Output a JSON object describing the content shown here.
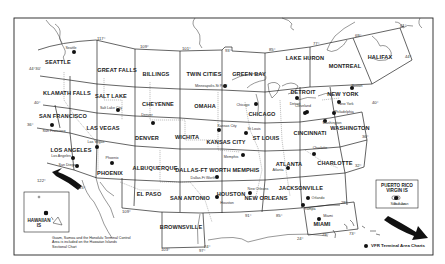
{
  "map": {
    "title": "Sectional Aeronautical Charts coverage of the United States",
    "sectionals": [
      {
        "name": "SEATTLE",
        "x": 58,
        "y": 62
      },
      {
        "name": "GREAT FALLS",
        "x": 117,
        "y": 70
      },
      {
        "name": "BILLINGS",
        "x": 156,
        "y": 74
      },
      {
        "name": "TWIN CITIES",
        "x": 204,
        "y": 74
      },
      {
        "name": "GREEN BAY",
        "x": 249,
        "y": 74
      },
      {
        "name": "LAKE HURON",
        "x": 305,
        "y": 58
      },
      {
        "name": "MONTREAL",
        "x": 345,
        "y": 66
      },
      {
        "name": "HALIFAX",
        "x": 380,
        "y": 57
      },
      {
        "name": "KLAMATH FALLS",
        "x": 67,
        "y": 93
      },
      {
        "name": "SALT LAKE",
        "x": 111,
        "y": 96
      },
      {
        "name": "CHEYENNE",
        "x": 158,
        "y": 104
      },
      {
        "name": "OMAHA",
        "x": 205,
        "y": 106
      },
      {
        "name": "CHICAGO",
        "x": 262,
        "y": 114
      },
      {
        "name": "DETROIT",
        "x": 303,
        "y": 92
      },
      {
        "name": "NEW YORK",
        "x": 343,
        "y": 94
      },
      {
        "name": "SAN FRANCISCO",
        "x": 63,
        "y": 116
      },
      {
        "name": "LAS VEGAS",
        "x": 103,
        "y": 128
      },
      {
        "name": "DENVER",
        "x": 147,
        "y": 138
      },
      {
        "name": "WICHITA",
        "x": 187,
        "y": 137
      },
      {
        "name": "KANSAS CITY",
        "x": 226,
        "y": 142
      },
      {
        "name": "ST LOUIS",
        "x": 266,
        "y": 138
      },
      {
        "name": "CINCINNATI",
        "x": 310,
        "y": 133
      },
      {
        "name": "WASHINGTON",
        "x": 350,
        "y": 128
      },
      {
        "name": "LOS ANGELES",
        "x": 71,
        "y": 150
      },
      {
        "name": "PHOENIX",
        "x": 110,
        "y": 173
      },
      {
        "name": "ALBUQUERQUE",
        "x": 155,
        "y": 168
      },
      {
        "name": "DALLAS-FT WORTH",
        "x": 203,
        "y": 170
      },
      {
        "name": "MEMPHIS",
        "x": 246,
        "y": 170
      },
      {
        "name": "ATLANTA",
        "x": 289,
        "y": 164
      },
      {
        "name": "CHARLOTTE",
        "x": 335,
        "y": 163
      },
      {
        "name": "EL PASO",
        "x": 149,
        "y": 194
      },
      {
        "name": "SAN ANTONIO",
        "x": 190,
        "y": 198
      },
      {
        "name": "HOUSTON",
        "x": 231,
        "y": 194
      },
      {
        "name": "NEW ORLEANS",
        "x": 266,
        "y": 198
      },
      {
        "name": "JACKSONVILLE",
        "x": 301,
        "y": 188
      },
      {
        "name": "BROWNSVILLE",
        "x": 181,
        "y": 227
      },
      {
        "name": "MIAMI",
        "x": 322,
        "y": 224
      }
    ],
    "terminal_areas": [
      {
        "name": "Seattle",
        "x": 74,
        "y": 52,
        "dx": 71,
        "dy": 48
      },
      {
        "name": "Minneapolis-St Paul",
        "x": 225,
        "y": 86,
        "dx": 211,
        "dy": 86
      },
      {
        "name": "Salt Lake City",
        "x": 118,
        "y": 110,
        "dx": 111,
        "dy": 108
      },
      {
        "name": "San Francisco",
        "x": 52,
        "y": 125,
        "dx": 54,
        "dy": 131
      },
      {
        "name": "Las Vegas",
        "x": 97,
        "y": 147,
        "dx": 96,
        "dy": 142
      },
      {
        "name": "Los Angeles",
        "x": 73,
        "y": 158,
        "dx": 61,
        "dy": 156
      },
      {
        "name": "San Diego",
        "x": 77,
        "y": 166,
        "dx": 67,
        "dy": 165
      },
      {
        "name": "Phoenix",
        "x": 112,
        "y": 163,
        "dx": 112,
        "dy": 158
      },
      {
        "name": "Denver",
        "x": 153,
        "y": 123,
        "dx": 147,
        "dy": 115
      },
      {
        "name": "Kansas City",
        "x": 219,
        "y": 130,
        "dx": 227,
        "dy": 126
      },
      {
        "name": "St Louis",
        "x": 246,
        "y": 133,
        "dx": 254,
        "dy": 129
      },
      {
        "name": "Chicago",
        "x": 256,
        "y": 104,
        "dx": 243,
        "dy": 105
      },
      {
        "name": "Detroit",
        "x": 297,
        "y": 98,
        "dx": 295,
        "dy": 104
      },
      {
        "name": "Cleveland",
        "x": 307,
        "y": 112,
        "dx": 303,
        "dy": 106
      },
      {
        "name": "Pittsburgh",
        "x": 305,
        "y": 113,
        "dx": 0,
        "dy": 0
      },
      {
        "name": "Boston",
        "x": 352,
        "y": 88,
        "dx": 357,
        "dy": 86
      },
      {
        "name": "New York",
        "x": 339,
        "y": 102,
        "dx": 346,
        "dy": 104
      },
      {
        "name": "Philadelphia",
        "x": 334,
        "y": 113,
        "dx": 344,
        "dy": 112
      },
      {
        "name": "Washington",
        "x": 325,
        "y": 121,
        "dx": 332,
        "dy": 123
      },
      {
        "name": "Dallas-Ft Worth",
        "x": 217,
        "y": 177,
        "dx": 203,
        "dy": 178
      },
      {
        "name": "Memphis",
        "x": 243,
        "y": 155,
        "dx": 231,
        "dy": 157
      },
      {
        "name": "Atlanta",
        "x": 288,
        "y": 168,
        "dx": 278,
        "dy": 170
      },
      {
        "name": "Charlotte",
        "x": 314,
        "y": 154,
        "dx": 320,
        "dy": 148
      },
      {
        "name": "Houston",
        "x": 217,
        "y": 197,
        "dx": 227,
        "dy": 203
      },
      {
        "name": "New Orleans",
        "x": 250,
        "y": 193,
        "dx": 258,
        "dy": 189
      },
      {
        "name": "Orlando",
        "x": 308,
        "y": 198,
        "dx": 318,
        "dy": 198
      },
      {
        "name": "Tampa",
        "x": 303,
        "y": 205,
        "dx": 310,
        "dy": 209
      },
      {
        "name": "Miami",
        "x": 319,
        "y": 219,
        "dx": 328,
        "dy": 216
      },
      {
        "name": "Honolulu",
        "x": 46,
        "y": 213,
        "dx": 0,
        "dy": 0
      },
      {
        "name": "San Juan",
        "x": 396,
        "y": 198,
        "dx": 398,
        "dy": 204
      }
    ],
    "meridians": [
      {
        "label": "117°",
        "x": 97,
        "y": 36
      },
      {
        "label": "109°",
        "x": 140,
        "y": 44
      },
      {
        "label": "101°",
        "x": 182,
        "y": 46
      },
      {
        "label": "93°",
        "x": 225,
        "y": 48
      },
      {
        "label": "85°",
        "x": 269,
        "y": 47
      },
      {
        "label": "77°",
        "x": 313,
        "y": 41
      },
      {
        "label": "69°",
        "x": 355,
        "y": 33
      },
      {
        "label": "61°",
        "x": 400,
        "y": 23
      },
      {
        "label": "122°",
        "x": 37,
        "y": 178
      },
      {
        "label": "115°",
        "x": 77,
        "y": 185
      },
      {
        "label": "109°",
        "x": 122,
        "y": 209
      },
      {
        "label": "103°",
        "x": 161,
        "y": 247
      },
      {
        "label": "97°",
        "x": 199,
        "y": 248
      },
      {
        "label": "91°",
        "x": 245,
        "y": 213
      },
      {
        "label": "85°",
        "x": 276,
        "y": 213
      },
      {
        "label": "79°",
        "x": 322,
        "y": 232
      },
      {
        "label": "73°",
        "x": 349,
        "y": 231
      }
    ],
    "parallels": [
      {
        "label": "44°30'",
        "x": 29,
        "y": 66
      },
      {
        "label": "40°",
        "x": 34,
        "y": 100
      },
      {
        "label": "36°",
        "x": 27,
        "y": 122
      },
      {
        "label": "44°",
        "x": 405,
        "y": 54
      },
      {
        "label": "40°",
        "x": 372,
        "y": 100
      },
      {
        "label": "36°",
        "x": 362,
        "y": 134
      },
      {
        "label": "32°",
        "x": 355,
        "y": 163
      },
      {
        "label": "28°",
        "x": 341,
        "y": 200
      },
      {
        "label": "24°",
        "x": 204,
        "y": 244
      },
      {
        "label": "24°",
        "x": 297,
        "y": 236
      }
    ],
    "insets": {
      "hawaii": {
        "title": "HAWAIIAN",
        "subtitle": "IS"
      },
      "puerto_rico": {
        "line1": "PUERTO RICO",
        "line2": "VIRGIN IS",
        "city": "San Juan"
      }
    },
    "note": "Guam, Samoa and the Honolulu Terminal Control Area is included on the Hawaiian Islands Sectional Chart",
    "legend": {
      "label": "VFR Terminal Area Charts"
    },
    "colors": {
      "ink": "#1a1a1a",
      "paper": "#ffffff",
      "line": "#333333"
    }
  }
}
